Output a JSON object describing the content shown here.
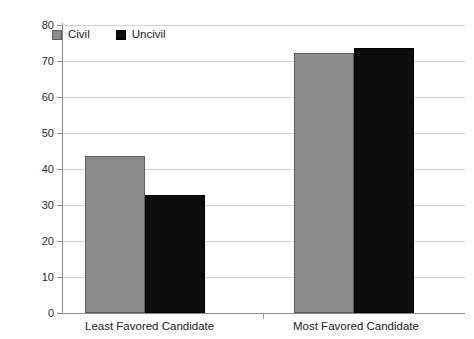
{
  "chart_data": {
    "type": "bar",
    "title": "",
    "subtitle": "",
    "xlabel": "",
    "ylabel": "",
    "categories": [
      "Least Favored Candidate",
      "Most Favored Candidate"
    ],
    "series": [
      {
        "name": "Civil",
        "color": "#8c8c8c",
        "values": [
          43.7,
          72.3
        ]
      },
      {
        "name": "Uncivil",
        "color": "#0d0d0d",
        "values": [
          32.7,
          73.6
        ]
      }
    ],
    "ylim": [
      0,
      80
    ],
    "ytick_step": 10,
    "yticks": [
      80,
      70,
      60,
      50,
      40,
      30,
      20,
      10,
      0
    ],
    "ytick_labels": [
      "80",
      "70",
      "60",
      "50",
      "40",
      "30",
      "20",
      "10",
      "0"
    ],
    "grid": "horizontal",
    "legend_position": "top-left-inside",
    "annotations": []
  },
  "legend": {
    "items": [
      {
        "label": "Civil",
        "swatch": "civil-swatch-icon"
      },
      {
        "label": "Uncivil",
        "swatch": "uncivil-swatch-icon"
      }
    ]
  }
}
